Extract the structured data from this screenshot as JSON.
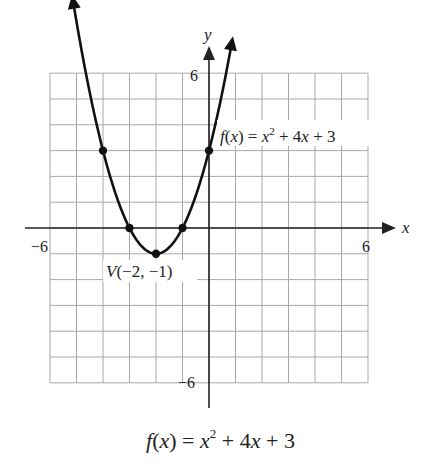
{
  "chart_data": {
    "type": "line",
    "function": "f(x) = x^2 + 4x + 3",
    "xlabel": "x",
    "ylabel": "y",
    "xlim": [
      -6,
      6
    ],
    "ylim": [
      -6,
      6
    ],
    "grid": true,
    "grid_step": 1,
    "x_tick_labels": [
      "-6",
      "6"
    ],
    "y_tick_labels": [
      "6",
      "-6"
    ],
    "marked_points": [
      {
        "x": -4,
        "y": 3
      },
      {
        "x": -3,
        "y": 0
      },
      {
        "x": -2,
        "y": -1
      },
      {
        "x": -1,
        "y": 0
      },
      {
        "x": 0,
        "y": 3
      }
    ],
    "vertex": {
      "x": -2,
      "y": -1,
      "label": "V(−2, −1)"
    },
    "annotations": [
      {
        "text": "f(x) = x^2 + 4x + 3",
        "near": {
          "x": 0,
          "y": 4.5
        }
      },
      {
        "text": "V(−2, −1)",
        "near": {
          "x": -2,
          "y": -1.8
        }
      }
    ],
    "series": [
      {
        "name": "f(x)",
        "x": [
          -5.2,
          -5,
          -4,
          -3,
          -2,
          -1,
          0,
          0.8
        ],
        "y": [
          7.44,
          8,
          3,
          0,
          -1,
          0,
          3,
          6.84
        ]
      }
    ]
  },
  "labels": {
    "x_axis": "x",
    "y_axis": "y",
    "x_min": "−6",
    "x_max": "6",
    "y_max": "6",
    "y_min": "−6",
    "vertex": "V(−2, −1)",
    "curve_fx": "f(x) = ",
    "curve_x": "x",
    "curve_sq": "2",
    "curve_rest": " + 4x + 3",
    "caption_f": "f",
    "caption_paren": "(x) = ",
    "caption_x": "x",
    "caption_sq": "2",
    "caption_rest": " + 4x + 3"
  },
  "colors": {
    "grid": "#a8a8a8",
    "axis": "#222222",
    "curve": "#111111"
  }
}
